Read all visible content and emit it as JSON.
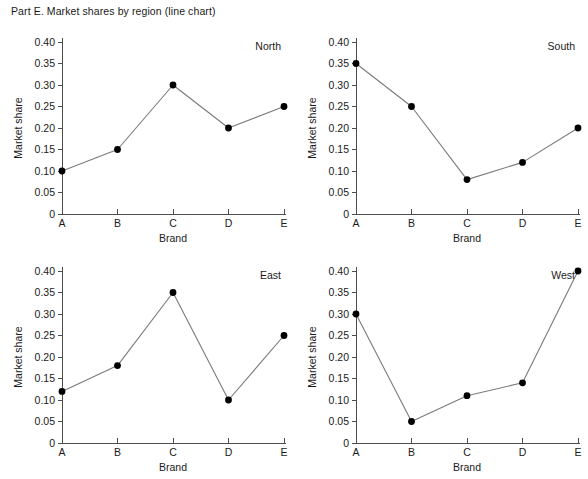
{
  "figure": {
    "title": "Part E. Market shares by region (line chart)"
  },
  "chart_data": {
    "type": "line",
    "title": "Part E. Market shares by region (line chart)",
    "xlabel": "Brand",
    "ylabel": "Market share",
    "categories": [
      "A",
      "B",
      "C",
      "D",
      "E"
    ],
    "ylim": [
      0,
      0.4
    ],
    "yticks": [
      0,
      0.05,
      0.1,
      0.15,
      0.2,
      0.25,
      0.3,
      0.35,
      0.4
    ],
    "ytick_labels": [
      "0",
      "0.05",
      "0.10",
      "0.15",
      "0.20",
      "0.25",
      "0.30",
      "0.35",
      "0.40"
    ],
    "grid": false,
    "legend": "none",
    "panel_label_position": "top-right",
    "marker": "filled-circle",
    "line_color": "#7a7a7a",
    "marker_color": "#000000",
    "panels": [
      {
        "id": "north",
        "label": "North",
        "values": [
          0.1,
          0.15,
          0.3,
          0.2,
          0.25
        ]
      },
      {
        "id": "south",
        "label": "South",
        "values": [
          0.35,
          0.25,
          0.08,
          0.12,
          0.2
        ]
      },
      {
        "id": "east",
        "label": "East",
        "values": [
          0.12,
          0.18,
          0.35,
          0.1,
          0.25
        ]
      },
      {
        "id": "west",
        "label": "West",
        "values": [
          0.3,
          0.05,
          0.11,
          0.14,
          0.4
        ]
      }
    ]
  }
}
